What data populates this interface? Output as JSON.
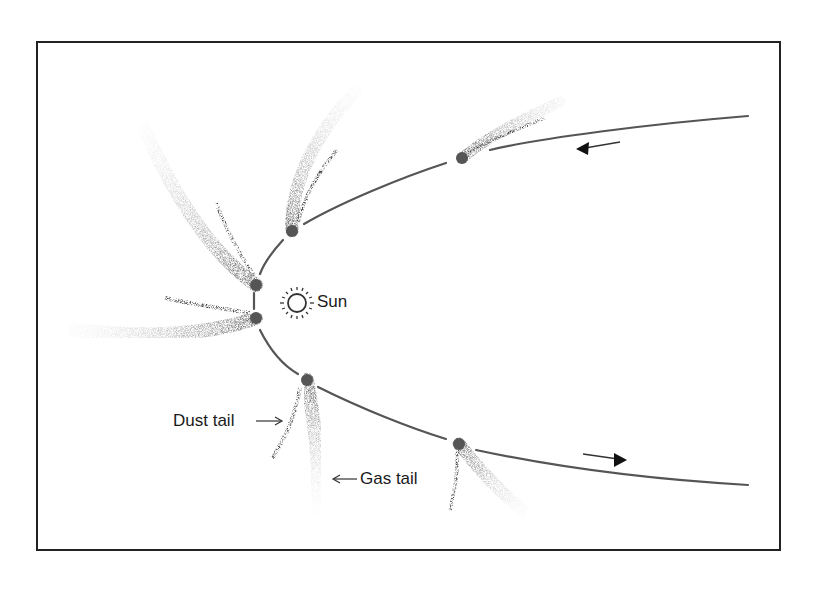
{
  "figure": {
    "frame": {
      "x": 37,
      "y": 42,
      "width": 743,
      "height": 508,
      "stroke": "#222222"
    },
    "colors": {
      "orbit": "#555555",
      "nucleus": "#555555",
      "tail_dark": "#333333",
      "tail_light": "#9a9a9a",
      "text": "#1a1a1a"
    },
    "sun": {
      "label": "Sun",
      "x": 297,
      "y": 303,
      "icon": "sun-icon"
    },
    "labels": {
      "dust_tail": "Dust tail",
      "gas_tail": "Gas tail"
    },
    "direction_arrows": [
      {
        "name": "incoming-arrow",
        "direction": "left"
      },
      {
        "name": "outgoing-arrow",
        "direction": "right"
      }
    ],
    "comet_positions": [
      {
        "id": 1,
        "x": 462,
        "y": 158
      },
      {
        "id": 2,
        "x": 292,
        "y": 231
      },
      {
        "id": 3,
        "x": 256,
        "y": 285
      },
      {
        "id": 4,
        "x": 256,
        "y": 318
      },
      {
        "id": 5,
        "x": 307,
        "y": 380
      },
      {
        "id": 6,
        "x": 459,
        "y": 444
      }
    ]
  }
}
